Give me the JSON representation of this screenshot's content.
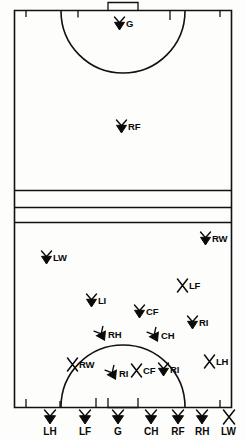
{
  "diagram": {
    "type": "sports-field-positions",
    "field": {
      "background_color": "#fdfdfc",
      "line_color": "#111111",
      "outline": {
        "x": 14,
        "y": 10,
        "width": 218,
        "height": 398
      },
      "top_goal_box": {
        "x": 108,
        "y": 2,
        "width": 30,
        "height": 9
      },
      "bottom_goal_box": {
        "x": 108,
        "y": 407,
        "width": 30,
        "height": 9
      },
      "top_arc_radius": 62,
      "bottom_arc_radius": 62,
      "midfield_lines_y": [
        190,
        207,
        222
      ],
      "tick_marks_top_x": [
        26,
        78,
        170,
        220
      ],
      "tick_marks_bottom_x": [
        26,
        60,
        96,
        220
      ]
    },
    "markers": [
      {
        "label": "G",
        "x": 113,
        "y": 16,
        "style": "filled-x"
      },
      {
        "label": "RF",
        "x": 115,
        "y": 119,
        "style": "filled-x"
      },
      {
        "label": "RW",
        "x": 199,
        "y": 231,
        "style": "filled-x"
      },
      {
        "label": "LW",
        "x": 40,
        "y": 250,
        "style": "filled-x"
      },
      {
        "label": "LF",
        "x": 176,
        "y": 278,
        "style": "open-x"
      },
      {
        "label": "LI",
        "x": 85,
        "y": 293,
        "style": "filled-x"
      },
      {
        "label": "RI",
        "x": 186,
        "y": 315,
        "style": "filled-x"
      },
      {
        "label": "CF",
        "x": 133,
        "y": 304,
        "style": "filled-x"
      },
      {
        "label": "RH",
        "x": 95,
        "y": 327,
        "style": "filled-x-rot"
      },
      {
        "label": "CH",
        "x": 148,
        "y": 328,
        "style": "filled-x-rot"
      },
      {
        "label": "RW",
        "x": 66,
        "y": 357,
        "style": "open-x"
      },
      {
        "label": "LH",
        "x": 203,
        "y": 354,
        "style": "open-x"
      },
      {
        "label": "RI",
        "x": 106,
        "y": 366,
        "style": "filled-x-rot"
      },
      {
        "label": "CF",
        "x": 130,
        "y": 363,
        "style": "open-x"
      },
      {
        "label": "RI",
        "x": 157,
        "y": 362,
        "style": "filled-x"
      }
    ],
    "bottom_row": [
      {
        "label": "LH",
        "x": 50,
        "style": "filled-x"
      },
      {
        "label": "LF",
        "x": 85,
        "style": "filled-x"
      },
      {
        "label": "G",
        "x": 118,
        "style": "filled-x"
      },
      {
        "label": "CH",
        "x": 151,
        "style": "filled-x"
      },
      {
        "label": "RF",
        "x": 178,
        "style": "filled-x"
      },
      {
        "label": "RH",
        "x": 202,
        "style": "filled-x"
      },
      {
        "label": "LW",
        "x": 228,
        "style": "open-x"
      }
    ],
    "bottom_row_y": 408
  }
}
